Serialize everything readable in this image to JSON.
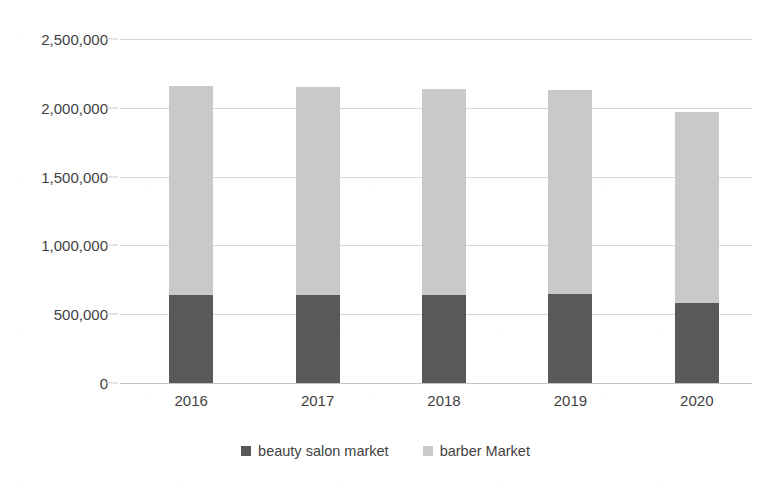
{
  "chart_data": {
    "type": "bar",
    "subtype": "stacked-column",
    "title": "",
    "xlabel": "",
    "ylabel": "",
    "categories": [
      "2016",
      "2017",
      "2018",
      "2019",
      "2020"
    ],
    "series": [
      {
        "name": "beauty salon market",
        "color": "#595959",
        "values": [
          642000,
          642000,
          640000,
          645000,
          583000
        ]
      },
      {
        "name": "barber Market",
        "color": "#c9c9c9",
        "values": [
          1518000,
          1508000,
          1500000,
          1485000,
          1387000
        ]
      }
    ],
    "totals": [
      2160000,
      2150000,
      2140000,
      2130000,
      1970000
    ],
    "ylim": [
      0,
      2500000
    ],
    "ytick_values": [
      0,
      500000,
      1000000,
      1500000,
      2000000,
      2500000
    ],
    "ytick_labels": [
      "0",
      "500,000",
      "1,000,000",
      "1,500,000",
      "2,000,000",
      "2,500,000"
    ],
    "grid": true,
    "grid_axis": "y",
    "legend_position": "bottom"
  },
  "axes": {
    "y_ticks": [
      {
        "label": "2,500,000",
        "value": 2500000
      },
      {
        "label": "2,000,000",
        "value": 2000000
      },
      {
        "label": "1,500,000",
        "value": 1500000
      },
      {
        "label": "1,000,000",
        "value": 1000000
      },
      {
        "label": "500,000",
        "value": 500000
      },
      {
        "label": "0",
        "value": 0
      }
    ],
    "x_ticks": [
      {
        "label": "2016"
      },
      {
        "label": "2017"
      },
      {
        "label": "2018"
      },
      {
        "label": "2019"
      },
      {
        "label": "2020"
      }
    ]
  },
  "legend": {
    "items": [
      {
        "label": "beauty salon market",
        "color": "#595959"
      },
      {
        "label": "barber Market",
        "color": "#c9c9c9"
      }
    ]
  },
  "colors": {
    "beauty_salon": "#595959",
    "barber": "#c9c9c9",
    "gridline": "#d6d6d6",
    "text": "#3f3f3f",
    "background": "#ffffff"
  }
}
